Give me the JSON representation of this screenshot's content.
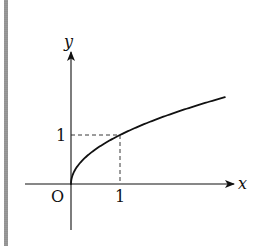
{
  "chart_data": {
    "type": "line",
    "title": "",
    "function": "y = sqrt(x)",
    "xlabel": "x",
    "ylabel": "y",
    "origin_label": "O",
    "x_ticks": [
      {
        "value": 1,
        "label": "1"
      }
    ],
    "y_ticks": [
      {
        "value": 1,
        "label": "1"
      }
    ],
    "xlim": [
      -0.95,
      3.3
    ],
    "ylim": [
      -0.75,
      2.7
    ],
    "grid": false,
    "legend": null,
    "series": [
      {
        "name": "y = √x",
        "x": [
          0,
          0.05,
          0.1,
          0.25,
          0.5,
          0.75,
          1,
          1.5,
          2,
          2.5,
          3,
          3.14
        ],
        "y": [
          0,
          0.224,
          0.316,
          0.5,
          0.707,
          0.866,
          1,
          1.225,
          1.414,
          1.581,
          1.732,
          1.772
        ]
      }
    ],
    "annotations": [
      {
        "type": "dashed-line",
        "from": [
          0,
          1
        ],
        "to": [
          1,
          1
        ]
      },
      {
        "type": "dashed-line",
        "from": [
          1,
          1
        ],
        "to": [
          1,
          0
        ]
      }
    ]
  },
  "labels": {
    "x_axis": "x",
    "y_axis": "y",
    "origin": "O",
    "x_tick_1": "1",
    "y_tick_1": "1"
  }
}
